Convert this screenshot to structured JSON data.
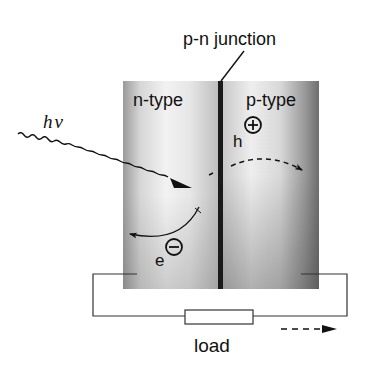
{
  "figure": {
    "labels": {
      "junction": "p-n junction",
      "n_region": "n-type",
      "p_region": "p-type",
      "photon": "hν",
      "hole": "h",
      "electron": "e",
      "load": "load"
    },
    "symbols": {
      "hole_charge": "plus-circle",
      "electron_charge": "minus-circle"
    },
    "colors": {
      "line": "#1a1a1a",
      "junction": "#1a1a1a",
      "panel_light": "#f2f2f2",
      "panel_dark": "#6e6e6e"
    }
  }
}
